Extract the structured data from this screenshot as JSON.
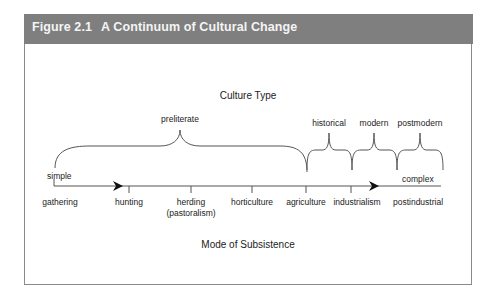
{
  "figure": {
    "number": "Figure 2.1",
    "title": "A Continuum of Cultural Change"
  },
  "top_axis_label": "Culture Type",
  "bottom_axis_label": "Mode of Subsistence",
  "ends": {
    "left": "simple",
    "right": "complex"
  },
  "culture_types": [
    {
      "label": "preliterate",
      "from": "gathering",
      "to": "agriculture"
    },
    {
      "label": "historical",
      "from": "agriculture",
      "to": "industrialism"
    },
    {
      "label": "modern",
      "from": "industrialism",
      "to": "postindustrial"
    },
    {
      "label": "postmodern",
      "from": "postindustrial",
      "to": "end"
    }
  ],
  "subsistence_modes": [
    {
      "label": "gathering"
    },
    {
      "label": "hunting"
    },
    {
      "label": "herding",
      "sub": "(pastoralism)"
    },
    {
      "label": "horticulture"
    },
    {
      "label": "agriculture"
    },
    {
      "label": "industrialism"
    },
    {
      "label": "postindustrial"
    }
  ],
  "colors": {
    "header_bg": "#7f7f7f",
    "header_text": "#f4f4f4",
    "line": "#555555",
    "border": "#8a8a8a"
  }
}
